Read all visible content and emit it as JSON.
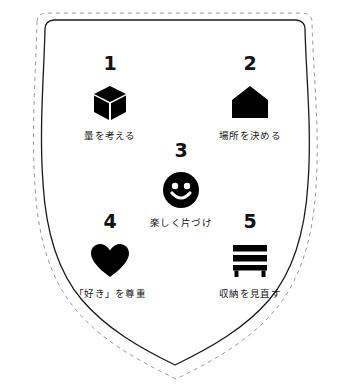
{
  "graphic": {
    "title": "",
    "shape": "shield-badge",
    "outline_color": "#1a1a1a",
    "dashed_outline_color": "#9a9a9a",
    "background_color": "#ffffff",
    "icon_color": "#000000",
    "text_color": "#141414"
  },
  "items": [
    {
      "number": "1",
      "icon": "cube-icon",
      "caption": "量を考える"
    },
    {
      "number": "2",
      "icon": "house-icon",
      "caption": "場所を決める"
    },
    {
      "number": "3",
      "icon": "smiley-face-icon",
      "caption": "楽しく片づけ"
    },
    {
      "number": "4",
      "icon": "heart-icon",
      "caption": "「好き」を尊重"
    },
    {
      "number": "5",
      "icon": "shelf-icon",
      "caption": "収納を見直す"
    }
  ]
}
